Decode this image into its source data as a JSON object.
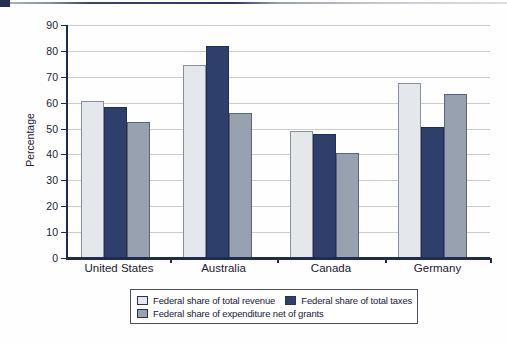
{
  "decor": {
    "corner_accent_color": "#232f56"
  },
  "chart_data": {
    "type": "bar",
    "title": "",
    "xlabel": "",
    "ylabel": "Percentage",
    "ylim": [
      0,
      90
    ],
    "yticks": [
      0,
      10,
      20,
      30,
      40,
      50,
      60,
      70,
      80,
      90
    ],
    "grid": "horizontal",
    "legend_position": "bottom",
    "categories": [
      "United States",
      "Australia",
      "Canada",
      "Germany"
    ],
    "series": [
      {
        "name": "Federal share of total revenue",
        "color": "#e4e8ec",
        "border": "#8a8f9c",
        "values": [
          60.5,
          74.5,
          49,
          67.5
        ]
      },
      {
        "name": "Federal share of total taxes",
        "color": "#2e3f6b",
        "border": "#232e52",
        "values": [
          58.5,
          82,
          48,
          50.5
        ]
      },
      {
        "name": "Federal share of expenditure net of grants",
        "color": "#98a1b0",
        "border": "#5d6578",
        "values": [
          52.5,
          56,
          40.5,
          63.5
        ]
      }
    ],
    "legend_rows": [
      [
        0,
        1
      ],
      [
        2
      ]
    ],
    "axis_color": "#1f2c52",
    "grid_color": "#c9cdd2",
    "tick_label_color": "#1c2233"
  }
}
